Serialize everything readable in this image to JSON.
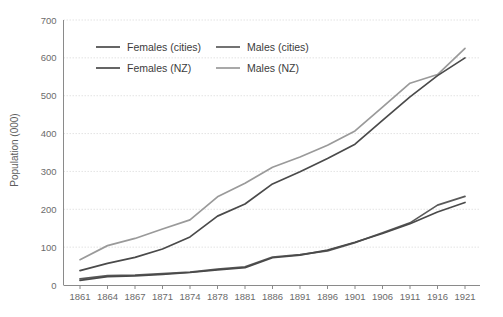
{
  "chart_data": {
    "type": "line",
    "title": "",
    "xlabel": "",
    "ylabel": "Population (000)",
    "ylim": [
      0,
      700
    ],
    "ytick_values": [
      0,
      100,
      200,
      300,
      400,
      500,
      600,
      700
    ],
    "ytick_labels": [
      "0",
      "100",
      "200",
      "300",
      "400",
      "500",
      "600",
      "700"
    ],
    "grid": true,
    "legend_position": "top-left",
    "categories": [
      "1861",
      "1864",
      "1867",
      "1871",
      "1874",
      "1878",
      "1881",
      "1886",
      "1891",
      "1896",
      "1901",
      "1906",
      "1911",
      "1916",
      "1921"
    ],
    "series": [
      {
        "name": "Females (cities)",
        "color": "#4a4a4a",
        "values": [
          12,
          22,
          24,
          28,
          33,
          40,
          46,
          72,
          79,
          92,
          113,
          136,
          162,
          193,
          218
        ]
      },
      {
        "name": "Males (cities)",
        "color": "#5a5a5a",
        "values": [
          16,
          25,
          26,
          30,
          34,
          42,
          48,
          74,
          80,
          90,
          112,
          138,
          164,
          211,
          234
        ]
      },
      {
        "name": "Females (NZ)",
        "color": "#4a4a4a",
        "values": [
          38,
          57,
          73,
          95,
          127,
          182,
          214,
          267,
          299,
          334,
          372,
          435,
          497,
          553,
          600
        ]
      },
      {
        "name": "Males (NZ)",
        "color": "#9a9a9a",
        "values": [
          67,
          104,
          123,
          148,
          172,
          233,
          269,
          311,
          338,
          369,
          407,
          470,
          533,
          556,
          625
        ]
      }
    ]
  },
  "legend": {
    "entries": [
      {
        "label": "Females (cities)",
        "color": "#4a4a4a"
      },
      {
        "label": "Males (cities)",
        "color": "#5a5a5a"
      },
      {
        "label": "Females (NZ)",
        "color": "#4a4a4a"
      },
      {
        "label": "Males (NZ)",
        "color": "#9a9a9a"
      }
    ]
  },
  "colors": {
    "grid": "#dcdcdc",
    "axis": "#8a8a8a",
    "tick_label": "#6b6b6b",
    "axis_title": "#5d5d5d",
    "background": "#ffffff"
  }
}
